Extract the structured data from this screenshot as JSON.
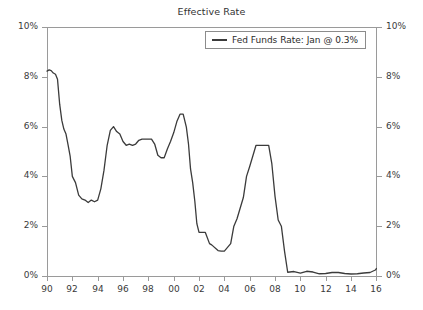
{
  "chart_data": {
    "type": "line",
    "title": "Effective Rate",
    "xlabel": "",
    "ylabel": "",
    "ylim": [
      0,
      10
    ],
    "xlim": [
      1990,
      2016.05
    ],
    "grid": false,
    "legend_position": "top-right",
    "y_tick_labels_left": [
      "10%",
      "8%",
      "6%",
      "4%",
      "2%",
      "0%"
    ],
    "y_tick_labels_right": [
      "10%",
      "8%",
      "6%",
      "4%",
      "2%",
      "0%"
    ],
    "y_tick_values": [
      10,
      8,
      6,
      4,
      2,
      0
    ],
    "x_tick_labels": [
      "90",
      "92",
      "94",
      "96",
      "98",
      "00",
      "02",
      "04",
      "06",
      "08",
      "10",
      "12",
      "14",
      "16"
    ],
    "x_tick_values": [
      1990,
      1992,
      1994,
      1996,
      1998,
      2000,
      2002,
      2004,
      2006,
      2008,
      2010,
      2012,
      2014,
      2016
    ],
    "series": [
      {
        "name": "Fed Funds Rate: Jan @ 0.3%",
        "color": "#3b3b3b",
        "latest_label": "Jan @ 0.3%",
        "latest_value": 0.3,
        "x": [
          1990.0,
          1990.17,
          1990.33,
          1990.5,
          1990.67,
          1990.83,
          1991.0,
          1991.17,
          1991.33,
          1991.5,
          1991.67,
          1991.83,
          1992.0,
          1992.25,
          1992.5,
          1992.75,
          1993.0,
          1993.25,
          1993.5,
          1993.75,
          1994.0,
          1994.25,
          1994.5,
          1994.75,
          1995.0,
          1995.25,
          1995.5,
          1995.75,
          1996.0,
          1996.25,
          1996.5,
          1996.75,
          1997.0,
          1997.25,
          1997.5,
          1997.75,
          1998.0,
          1998.25,
          1998.5,
          1998.75,
          1999.0,
          1999.25,
          1999.5,
          1999.75,
          2000.0,
          2000.25,
          2000.5,
          2000.75,
          2001.0,
          2001.17,
          2001.33,
          2001.5,
          2001.67,
          2001.83,
          2002.0,
          2002.5,
          2002.83,
          2003.0,
          2003.5,
          2003.75,
          2004.0,
          2004.5,
          2004.75,
          2005.0,
          2005.5,
          2005.75,
          2006.0,
          2006.5,
          2006.75,
          2007.0,
          2007.5,
          2007.75,
          2008.0,
          2008.25,
          2008.5,
          2008.75,
          2009.0,
          2009.5,
          2010.0,
          2010.5,
          2011.0,
          2011.5,
          2012.0,
          2012.5,
          2013.0,
          2013.5,
          2014.0,
          2014.5,
          2015.0,
          2015.5,
          2015.92,
          2016.0
        ],
        "y": [
          8.23,
          8.28,
          8.25,
          8.15,
          8.1,
          7.9,
          6.9,
          6.25,
          5.9,
          5.7,
          5.25,
          4.8,
          4.0,
          3.75,
          3.25,
          3.1,
          3.05,
          2.95,
          3.05,
          2.98,
          3.05,
          3.5,
          4.25,
          5.25,
          5.85,
          6.0,
          5.8,
          5.7,
          5.4,
          5.25,
          5.3,
          5.25,
          5.3,
          5.45,
          5.5,
          5.5,
          5.5,
          5.5,
          5.3,
          4.85,
          4.75,
          4.75,
          5.1,
          5.4,
          5.75,
          6.2,
          6.5,
          6.5,
          5.98,
          5.3,
          4.3,
          3.75,
          3.0,
          2.1,
          1.75,
          1.75,
          1.3,
          1.25,
          1.02,
          1.0,
          1.0,
          1.3,
          2.0,
          2.3,
          3.15,
          4.0,
          4.4,
          5.25,
          5.25,
          5.25,
          5.25,
          4.5,
          3.2,
          2.25,
          2.0,
          1.0,
          0.15,
          0.18,
          0.12,
          0.19,
          0.16,
          0.09,
          0.1,
          0.14,
          0.14,
          0.1,
          0.08,
          0.09,
          0.12,
          0.14,
          0.24,
          0.3
        ]
      }
    ]
  },
  "legend": {
    "entry_label": "Fed Funds Rate: Jan @ 0.3%"
  },
  "title": {
    "text": "Effective Rate"
  }
}
